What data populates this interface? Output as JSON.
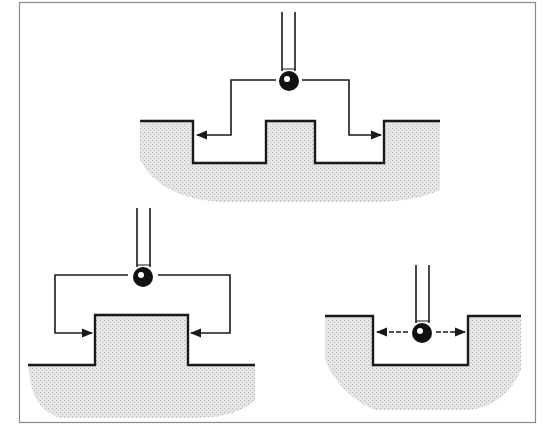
{
  "figure": {
    "colors": {
      "background": "#ffffff",
      "frame": "#8a8a8a",
      "line": "#1a1a1a",
      "fill": "#e4e4e4",
      "stipple": "#b5b5b5",
      "ball": "#111111"
    },
    "panels": [
      {
        "id": "top",
        "label": "stepped-groove-measurement",
        "probe": {
          "stem_x": [
            282,
            295
          ],
          "stem_top": 12,
          "ball": [
            289,
            81
          ],
          "ball_r": 10
        },
        "arrows": [
          "left-outward",
          "right-outward"
        ]
      },
      {
        "id": "bottom-left",
        "label": "external-boss-measurement",
        "probe": {
          "stem_x": [
            137,
            150
          ],
          "stem_top": 208,
          "ball": [
            143,
            277
          ],
          "ball_r": 10
        },
        "arrows": [
          "left-inward",
          "right-inward"
        ]
      },
      {
        "id": "bottom-right",
        "label": "internal-slot-measurement",
        "probe": {
          "stem_x": [
            416,
            429
          ],
          "stem_top": 265,
          "ball": [
            422,
            333
          ],
          "ball_r": 10
        },
        "arrows": [
          "left-outward",
          "right-outward"
        ]
      }
    ]
  }
}
